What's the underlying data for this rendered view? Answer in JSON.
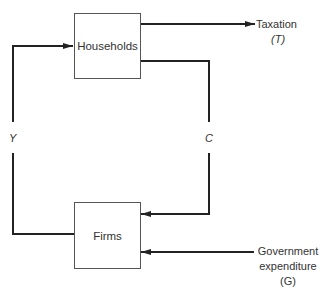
{
  "diagram": {
    "nodes": {
      "households": "Households",
      "firms": "Firms"
    },
    "flows": {
      "income": "Y",
      "consumption": "C",
      "taxation_label": "Taxation",
      "taxation_symbol": "(T)",
      "gov_line1": "Government",
      "gov_line2": "expenditure",
      "gov_symbol": "(G)"
    },
    "colors": {
      "line": "#222222",
      "box_border": "#555555"
    }
  }
}
